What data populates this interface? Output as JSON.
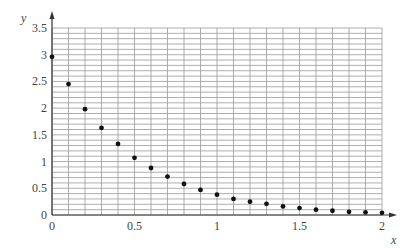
{
  "chart_data": {
    "type": "scatter",
    "title": "",
    "xlabel": "x",
    "ylabel": "y",
    "xlim": [
      0,
      2
    ],
    "ylim": [
      0,
      3.5
    ],
    "grid": true,
    "grid_minor_step_x": 0.1,
    "grid_minor_step_y": 0.1,
    "legend": null,
    "x_ticks": [
      0,
      0.5,
      1,
      1.5,
      2
    ],
    "x_tick_labels": [
      "0",
      "0.5",
      "1",
      "1.5",
      "2"
    ],
    "y_ticks": [
      0,
      0.5,
      1,
      1.5,
      2,
      2.5,
      3,
      3.5
    ],
    "y_tick_labels": [
      "0",
      "0.5",
      "1",
      "1.5",
      "2",
      "2.5",
      "3",
      "3.5"
    ],
    "series": [
      {
        "name": "points",
        "x": [
          0,
          0.1,
          0.2,
          0.3,
          0.4,
          0.5,
          0.6,
          0.7,
          0.8,
          0.9,
          1.0,
          1.1,
          1.2,
          1.3,
          1.4,
          1.5,
          1.6,
          1.7,
          1.8,
          1.9,
          2.0
        ],
        "y": [
          2.96,
          2.45,
          1.98,
          1.63,
          1.33,
          1.07,
          0.88,
          0.72,
          0.58,
          0.47,
          0.38,
          0.3,
          0.25,
          0.21,
          0.16,
          0.13,
          0.1,
          0.08,
          0.06,
          0.05,
          0.04
        ]
      }
    ]
  },
  "colors": {
    "grid": "#9a9a9a",
    "axis": "#333333",
    "point": "#111111",
    "text": "#444444"
  }
}
